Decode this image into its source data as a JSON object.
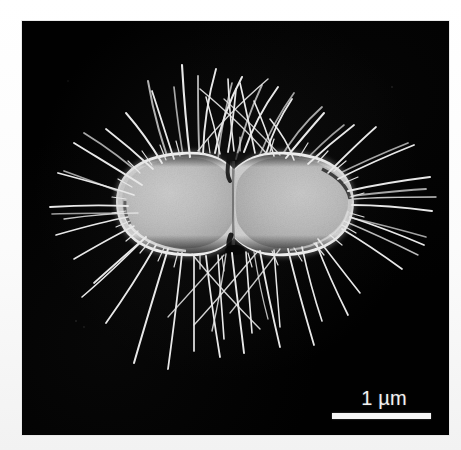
{
  "figure": {
    "kind": "scanning-electron-micrograph",
    "background_color": "#ffffff",
    "frame_color": "#010101",
    "specimen": "rod-shaped bacterium with peritrichous fimbriae",
    "cell_body_color": "#b9b9b9",
    "fimbriae_color": "#e6e6e6"
  },
  "scale_bar": {
    "label": "1 µm",
    "bar_color": "#f6f6f6",
    "bar_length_px": 99,
    "text_color": "#f2f2f2"
  }
}
